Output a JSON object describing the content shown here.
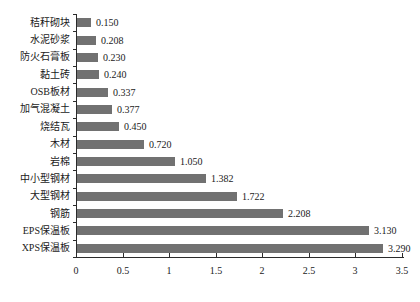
{
  "chart_data": {
    "type": "bar",
    "orientation": "horizontal",
    "title": "",
    "xlabel": "",
    "ylabel": "",
    "categories": [
      "秸秆砌块",
      "水泥砂浆",
      "防火石膏板",
      "黏土砖",
      "OSB板材",
      "加气混凝土",
      "烧结瓦",
      "木材",
      "岩棉",
      "中小型钢材",
      "大型钢材",
      "钢筋",
      "EPS保温板",
      "XPS保温板"
    ],
    "values": [
      0.15,
      0.208,
      0.23,
      0.24,
      0.337,
      0.377,
      0.45,
      0.72,
      1.05,
      1.382,
      1.722,
      2.208,
      3.13,
      3.29
    ],
    "value_labels": [
      "0.150",
      "0.208",
      "0.230",
      "0.240",
      "0.337",
      "0.377",
      "0.450",
      "0.720",
      "1.050",
      "1.382",
      "1.722",
      "2.208",
      "3.130",
      "3.290"
    ],
    "xlim": [
      0,
      3.5
    ],
    "x_ticks": [
      0,
      0.5,
      1,
      1.5,
      2,
      2.5,
      3,
      3.5
    ],
    "x_tick_labels": [
      "0",
      "0.5",
      "1",
      "1.5",
      "2",
      "2.5",
      "3",
      "3.5"
    ],
    "grid": false,
    "legend": false,
    "data_labels": true,
    "bar_color": "#717171",
    "axis_color": "#2b2b2b",
    "text_color": "#1a1a1a",
    "background": "#ffffff"
  }
}
